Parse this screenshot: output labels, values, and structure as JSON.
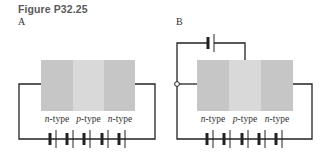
{
  "figure": {
    "title": "Figure P32.25"
  },
  "panels": [
    {
      "label": "A",
      "regions": [
        {
          "type_letter": "n",
          "suffix": "-type"
        },
        {
          "type_letter": "p",
          "suffix": "-type"
        },
        {
          "type_letter": "n",
          "suffix": "-type"
        }
      ],
      "bottom_battery_cells": 5
    },
    {
      "label": "B",
      "regions": [
        {
          "type_letter": "n",
          "suffix": "-type"
        },
        {
          "type_letter": "p",
          "suffix": "-type"
        },
        {
          "type_letter": "n",
          "suffix": "-type"
        }
      ],
      "top_battery_cells": 1,
      "bottom_battery_cells": 5
    }
  ],
  "colors": {
    "n_region": "#c6c6c6",
    "p_region": "#d9d9d9",
    "wire": "#222222"
  }
}
